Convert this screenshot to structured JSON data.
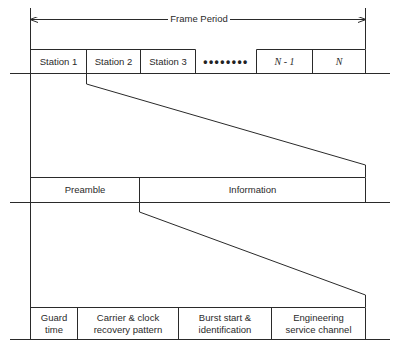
{
  "diagram": {
    "frame_period_label": "Frame Period",
    "line_color": "#2a2a2a",
    "frame_row": {
      "slots": [
        {
          "label": "Station 1",
          "italic": false
        },
        {
          "label": "Station 2",
          "italic": false
        },
        {
          "label": "Station 3",
          "italic": false
        },
        {
          "label": "N - 1",
          "italic": true
        },
        {
          "label": "N",
          "italic": true
        }
      ],
      "ellipsis": "••••••••"
    },
    "burst_row": {
      "segments": [
        {
          "label": "Preamble"
        },
        {
          "label": "Information"
        }
      ]
    },
    "preamble_row": {
      "segments": [
        {
          "label": "Guard\ntime"
        },
        {
          "label": "Carrier & clock\nrecovery pattern"
        },
        {
          "label": "Burst start &\nidentification"
        },
        {
          "label": "Engineering\nservice channel"
        }
      ]
    }
  }
}
